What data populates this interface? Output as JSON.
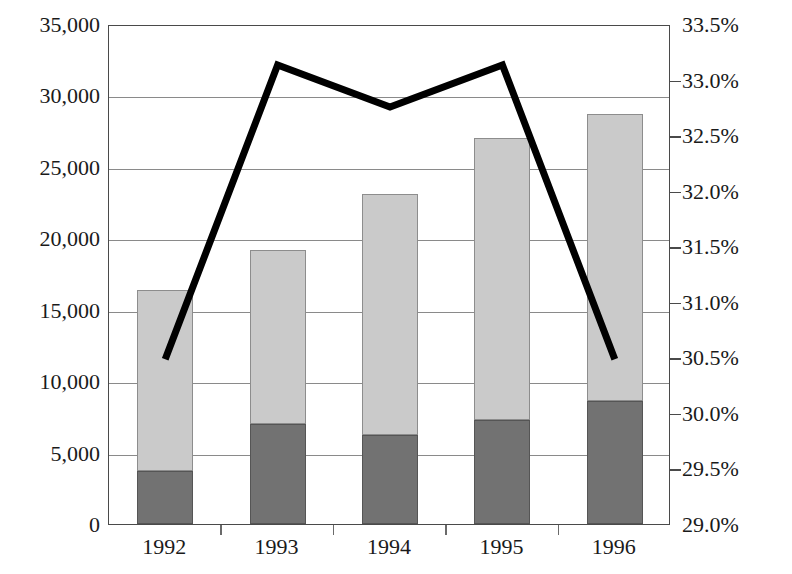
{
  "chart_data": {
    "type": "bar",
    "title": "",
    "subtitle": "",
    "xlabel": "",
    "ylabel": "",
    "categories": [
      "1992",
      "1993",
      "1994",
      "1995",
      "1996"
    ],
    "stacked": true,
    "grid": true,
    "legend": "none",
    "left_axis": {
      "ylabel": "",
      "ylim": [
        0,
        35000
      ],
      "tick_step": 5000,
      "ticks": [
        0,
        5000,
        10000,
        15000,
        20000,
        25000,
        30000,
        35000
      ],
      "tick_labels": [
        "0",
        "5,000",
        "10,000",
        "15,000",
        "20,000",
        "25,000",
        "30,000",
        "35,000"
      ]
    },
    "right_axis": {
      "ylabel": "",
      "ylim": [
        29.0,
        33.5
      ],
      "tick_step": 0.5,
      "ticks": [
        29.0,
        29.5,
        30.0,
        30.5,
        31.0,
        31.5,
        32.0,
        32.5,
        33.0,
        33.5
      ],
      "tick_labels": [
        "29.0%",
        "29.5%",
        "30.0%",
        "30.5%",
        "31.0%",
        "31.5%",
        "32.0%",
        "32.5%",
        "33.0%",
        "33.5%"
      ]
    },
    "series": [
      {
        "name": "bottom-segment",
        "kind": "bar",
        "axis": "left",
        "color": "#727272",
        "values": [
          3700,
          7000,
          6200,
          7300,
          8600
        ]
      },
      {
        "name": "top-segment",
        "kind": "bar",
        "axis": "left",
        "color": "#cacaca",
        "values": [
          12700,
          12200,
          16900,
          19700,
          20100
        ]
      },
      {
        "name": "totals",
        "kind": "bar-total",
        "axis": "left",
        "values": [
          16400,
          19200,
          23100,
          27000,
          28700
        ]
      },
      {
        "name": "percentage-line",
        "kind": "line",
        "axis": "right",
        "color": "#000000",
        "values": [
          30.5,
          33.15,
          32.77,
          33.15,
          30.5
        ]
      }
    ]
  },
  "geometry": {
    "line_width": 7
  }
}
